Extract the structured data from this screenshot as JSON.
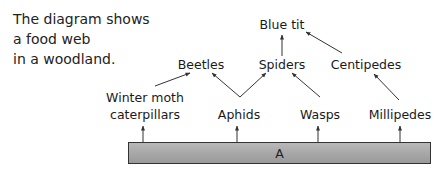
{
  "intro": {
    "lines": [
      "The diagram shows",
      "a food web",
      "in a woodland."
    ]
  },
  "food_web": {
    "nodes": {
      "blue_tit": "Blue tit",
      "beetles": "Beetles",
      "spiders": "Spiders",
      "centipedes": "Centipedes",
      "winter_moth_line1": "Winter moth",
      "winter_moth_line2": "caterpillars",
      "aphids": "Aphids",
      "wasps": "Wasps",
      "millipedes": "Millipedes"
    },
    "producer_label": "A",
    "links": [
      {
        "from": "A",
        "to": "Winter moth caterpillars"
      },
      {
        "from": "A",
        "to": "Aphids"
      },
      {
        "from": "A",
        "to": "Wasps"
      },
      {
        "from": "A",
        "to": "Millipedes"
      },
      {
        "from": "Winter moth caterpillars",
        "to": "Beetles"
      },
      {
        "from": "Aphids",
        "to": "Beetles"
      },
      {
        "from": "Aphids",
        "to": "Spiders"
      },
      {
        "from": "Wasps",
        "to": "Spiders"
      },
      {
        "from": "Millipedes",
        "to": "Centipedes"
      },
      {
        "from": "Spiders",
        "to": "Blue tit"
      },
      {
        "from": "Centipedes",
        "to": "Blue tit"
      }
    ]
  },
  "colors": {
    "text": "#1a1a1a",
    "arrow": "#333333",
    "bar_fill": "#a8a8a8",
    "bar_border": "#333333"
  }
}
